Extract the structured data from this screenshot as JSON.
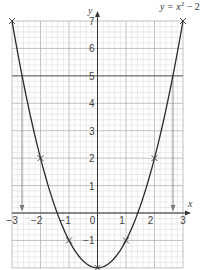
{
  "chart_data": {
    "type": "line",
    "title": "",
    "equation_label": "y = x² − 2",
    "xlabel": "x",
    "ylabel": "y",
    "xlim": [
      -3,
      3
    ],
    "ylim": [
      -2,
      7
    ],
    "x_ticks": [
      "-3",
      "-2",
      "-1",
      "0",
      "1",
      "2",
      "3"
    ],
    "y_ticks": [
      "-1",
      "1",
      "2",
      "3",
      "4",
      "5",
      "6",
      "7"
    ],
    "grid": true,
    "series": [
      {
        "name": "y = x^2 - 2",
        "points": [
          {
            "x": -3,
            "y": 7
          },
          {
            "x": -2,
            "y": 2
          },
          {
            "x": -1,
            "y": -1
          },
          {
            "x": 0,
            "y": -2
          },
          {
            "x": 1,
            "y": -1
          },
          {
            "x": 2,
            "y": 2
          },
          {
            "x": 3,
            "y": 7
          }
        ]
      }
    ],
    "annotations": [
      {
        "type": "horizontal_line",
        "y": 5
      },
      {
        "type": "down_arrow",
        "x": -2.65,
        "from_y": 5,
        "to_y": 0
      },
      {
        "type": "down_arrow",
        "x": 2.65,
        "from_y": 5,
        "to_y": 0
      }
    ]
  },
  "labels": {
    "x_axis": "x",
    "y_axis": "y",
    "equation_main": "y = x",
    "equation_sup": "2",
    "equation_tail": " − 2",
    "xt": [
      "−3",
      "−2",
      "−1",
      "0",
      "1",
      "2",
      "3"
    ],
    "yt": [
      "−1",
      "1",
      "2",
      "3",
      "4",
      "5",
      "6",
      "7"
    ]
  }
}
